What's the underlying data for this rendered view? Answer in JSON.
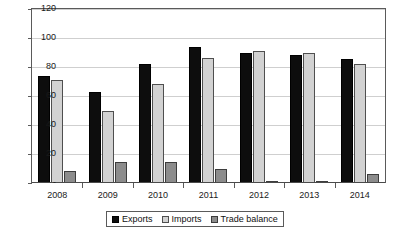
{
  "chart_data": {
    "type": "bar",
    "title": "",
    "subtitle": "",
    "xlabel": "",
    "ylabel": "",
    "categories": [
      "2008",
      "2009",
      "2010",
      "2011",
      "2012",
      "2013",
      "2014"
    ],
    "series": [
      {
        "name": "Exports",
        "values": [
          74,
          63,
          82,
          94,
          90,
          88.5,
          85.5
        ],
        "color": "#0d0d0d"
      },
      {
        "name": "Imports",
        "values": [
          71,
          50,
          68,
          86,
          91,
          90,
          82
        ],
        "color": "#d2d2d2"
      },
      {
        "name": "Trade balance",
        "values": [
          8,
          14.5,
          14.5,
          9.5,
          1,
          1,
          6
        ],
        "color": "#8c8c8c"
      }
    ],
    "ylim": [
      0,
      120
    ],
    "yticks": [
      0,
      20,
      40,
      60,
      80,
      100,
      120
    ],
    "ytick_labels": [
      "-",
      "20",
      "40",
      "60",
      "80",
      "100",
      "120"
    ],
    "grid": true,
    "legend_position": "bottom",
    "bar_group_style": "clustered"
  },
  "legend": {
    "items": [
      {
        "label": "Exports"
      },
      {
        "label": "Imports"
      },
      {
        "label": "Trade balance"
      }
    ]
  }
}
